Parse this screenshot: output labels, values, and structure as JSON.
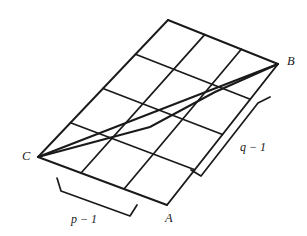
{
  "figure": {
    "kind": "lattice-parallelogram-diagram",
    "background_color": "#ffffff",
    "stroke_color": "#1a1a1a",
    "grid": {
      "columns": 3,
      "rows": 4,
      "column_count_label": "p - 1",
      "row_count_label": "q - 1"
    },
    "vertices": [
      {
        "name": "D",
        "label": "",
        "x": 168,
        "y": 20,
        "labelled": false
      },
      {
        "name": "B",
        "label": "B",
        "x": 278,
        "y": 64,
        "labelled": true
      },
      {
        "name": "A",
        "label": "A",
        "x": 167,
        "y": 205,
        "labelled": true
      },
      {
        "name": "C",
        "label": "C",
        "x": 38,
        "y": 157,
        "labelled": true
      }
    ],
    "labels": {
      "vertex_a": "A",
      "vertex_b": "B",
      "vertex_c": "C",
      "measure_p": "p − 1",
      "measure_q": "q − 1"
    },
    "diagonals": [
      {
        "from": "C",
        "to": "B",
        "name": "primary-diagonal"
      },
      {
        "from": "C",
        "to": "B",
        "name": "secondary-diagonal"
      }
    ],
    "brackets": [
      {
        "name": "p-bracket",
        "side": "bottom-left",
        "label": "p − 1"
      },
      {
        "name": "q-bracket",
        "side": "right",
        "label": "q − 1"
      }
    ]
  }
}
